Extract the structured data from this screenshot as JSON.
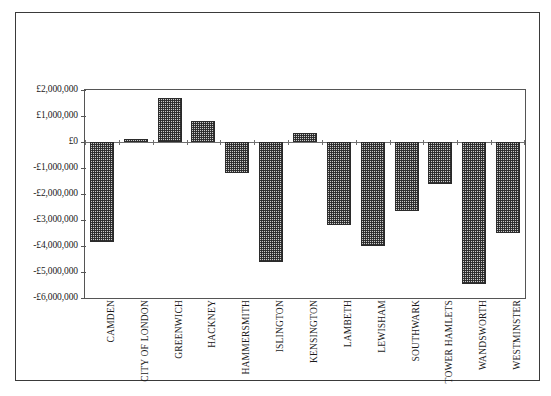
{
  "chart_data": {
    "type": "bar",
    "title": "",
    "subtitle": "",
    "xlabel": "",
    "ylabel": "",
    "currency_symbol": "£",
    "grid": false,
    "legend": false,
    "legend_position": "none",
    "orientation": "vertical",
    "bar_fill": "checkered-hatch",
    "bar_border_color": "#2b2b2b",
    "axis_color": "#555555",
    "frame_color": "#3a3a3a",
    "ylim": [
      -6000000,
      2000000
    ],
    "ytick_step": 1000000,
    "ytick_labels": [
      "£2,000,000",
      "£1,000,000",
      "£0",
      "-£1,000,000",
      "-£2,000,000",
      "-£3,000,000",
      "-£4,000,000",
      "-£5,000,000",
      "-£6,000,000"
    ],
    "ytick_values": [
      2000000,
      1000000,
      0,
      -1000000,
      -2000000,
      -3000000,
      -4000000,
      -5000000,
      -6000000
    ],
    "categories": [
      "CAMDEN",
      "CITY OF LONDON",
      "GREENWICH",
      "HACKNEY",
      "HAMMERSMITH",
      "ISLINGTON",
      "KENSINGTON",
      "LAMBETH",
      "LEWISHAM",
      "SOUTHWARK",
      "TOWER HAMLETS",
      "WANDSWORTH",
      "WESTMINSTER"
    ],
    "values": [
      -3850000,
      100000,
      1700000,
      800000,
      -1200000,
      -4600000,
      350000,
      -3200000,
      -4000000,
      -2650000,
      -1600000,
      -5450000,
      -3500000
    ]
  }
}
